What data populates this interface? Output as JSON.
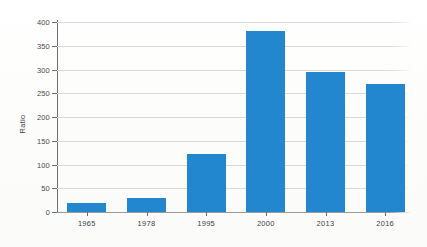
{
  "chart_data": {
    "type": "bar",
    "title": "",
    "subtitle": "",
    "xlabel": "",
    "ylabel": "Ratio",
    "categories": [
      "1965",
      "1978",
      "1995",
      "2000",
      "2013",
      "2016"
    ],
    "values": [
      19,
      29,
      122,
      382,
      295,
      269
    ],
    "series": [
      {
        "name": "Ratio",
        "values": [
          19,
          29,
          122,
          382,
          295,
          269
        ]
      }
    ],
    "ylim": [
      0,
      400
    ],
    "y_ticks": [
      0,
      50,
      100,
      150,
      200,
      250,
      300,
      350,
      400
    ],
    "y_tick_labels": [
      "0",
      "50",
      "100",
      "150",
      "200",
      "250",
      "300",
      "350",
      "400"
    ],
    "x_tick_labels": [
      "1965",
      "1978",
      "1995",
      "2000",
      "2013",
      "2016"
    ],
    "grid": true,
    "grid_axis": "y",
    "legend": false,
    "legend_position": "none",
    "annotations": [],
    "colors": {
      "bar": "#2287ce",
      "gridline": "#d9d9d9",
      "axis": "#6e6e6e",
      "tick_label": "#3f3f3f",
      "background": "#fefefe"
    }
  }
}
